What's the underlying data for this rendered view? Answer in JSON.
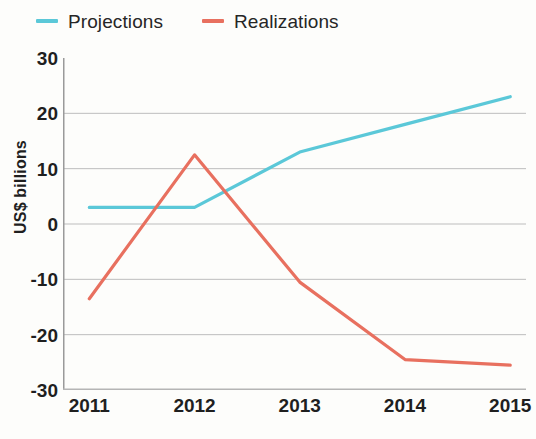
{
  "chart_data": {
    "type": "line",
    "title": "",
    "subtitle": "",
    "xlabel": "",
    "ylabel": "US$ billions",
    "x": [
      2011,
      2012,
      2013,
      2014,
      2015
    ],
    "x_tick_labels": [
      "2011",
      "2012",
      "2013",
      "2014",
      "2015"
    ],
    "y_tick_labels": [
      "30",
      "20",
      "10",
      "0",
      "-10",
      "-20",
      "-30"
    ],
    "y_ticks": [
      30,
      20,
      10,
      0,
      -10,
      -20,
      -30
    ],
    "xlim": [
      2010.75,
      2015.15
    ],
    "ylim": [
      -30,
      30
    ],
    "grid": "horizontal",
    "legend_position": "top-left",
    "series": [
      {
        "name": "Projections",
        "color": "#5BC8D8",
        "values": [
          3,
          3,
          13,
          18,
          23
        ]
      },
      {
        "name": "Realizations",
        "color": "#E8705F",
        "values": [
          -13.5,
          12.5,
          -10.5,
          -24.5,
          -25.5
        ]
      }
    ],
    "annotations": []
  },
  "legend": {
    "items": [
      {
        "label": "Projections",
        "color": "#5BC8D8"
      },
      {
        "label": "Realizations",
        "color": "#E8705F"
      }
    ]
  },
  "axes": {
    "y_title": "US$ billions"
  }
}
